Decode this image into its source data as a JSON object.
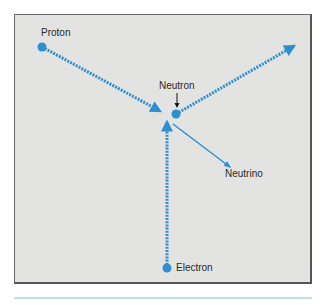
{
  "diagram": {
    "labels": {
      "proton": "Proton",
      "neutron": "Neutron",
      "neutrino": "Neutrino",
      "electron": "Electron"
    },
    "colors": {
      "particle": "#2e8fcf",
      "background": "#e3e3e1",
      "frame": "#555555",
      "text": "#2a2a2a"
    }
  }
}
